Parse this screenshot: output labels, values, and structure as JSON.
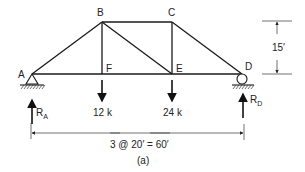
{
  "nodes": {
    "A": {
      "label": "A"
    },
    "B": {
      "label": "B"
    },
    "C": {
      "label": "C"
    },
    "D": {
      "label": "D"
    },
    "E": {
      "label": "E"
    },
    "F": {
      "label": "F"
    }
  },
  "loads": [
    {
      "node": "F",
      "label": "12 k"
    },
    {
      "node": "E",
      "label": "24 k"
    }
  ],
  "reactions": [
    {
      "node": "A",
      "label": "R",
      "subscript": "A"
    },
    {
      "node": "D",
      "label": "R",
      "subscript": "D"
    }
  ],
  "dimensions": {
    "height": "15′",
    "span": "3 @ 20′ = 60′"
  },
  "caption": "(a)"
}
